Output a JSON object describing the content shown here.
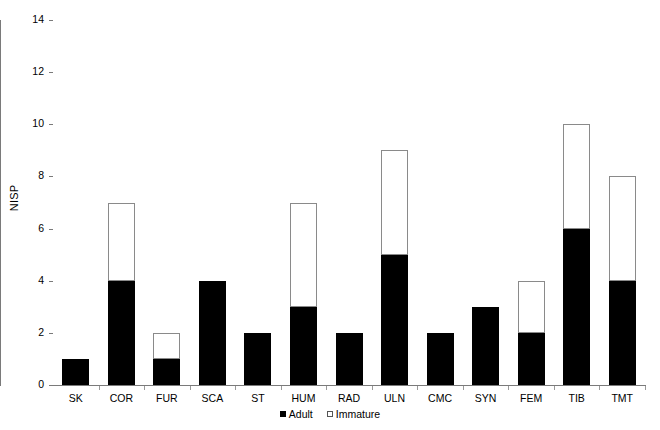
{
  "chart_data": {
    "type": "bar",
    "stacked": true,
    "title": "",
    "subtitle": "",
    "xlabel": "",
    "ylabel": "NISP",
    "ylim": [
      0,
      14
    ],
    "ytick_values": [
      0,
      2,
      4,
      6,
      8,
      10,
      12,
      14
    ],
    "ytick_labels": [
      "0",
      "2",
      "4",
      "6",
      "8",
      "10",
      "12",
      "14"
    ],
    "grid": false,
    "legend_position": "bottom-center",
    "categories": [
      "SK",
      "COR",
      "FUR",
      "SCA",
      "ST",
      "HUM",
      "RAD",
      "ULN",
      "CMC",
      "SYN",
      "FEM",
      "TIB",
      "TMT"
    ],
    "series": [
      {
        "name": "Adult",
        "color": "#000000",
        "values": [
          1,
          4,
          1,
          4,
          2,
          3,
          2,
          5,
          2,
          3,
          2,
          6,
          4
        ]
      },
      {
        "name": "Immature",
        "color": "#ffffff",
        "edge_color": "#8a8a8a",
        "values": [
          0,
          3,
          1,
          0,
          0,
          4,
          0,
          4,
          0,
          0,
          2,
          4,
          4
        ]
      }
    ],
    "totals": [
      1,
      7,
      2,
      4,
      2,
      7,
      2,
      9,
      2,
      3,
      4,
      10,
      8
    ]
  },
  "legend": {
    "items": [
      {
        "label": "Adult",
        "marker": "filled-square-icon"
      },
      {
        "label": "Immature",
        "marker": "open-square-icon"
      }
    ]
  }
}
